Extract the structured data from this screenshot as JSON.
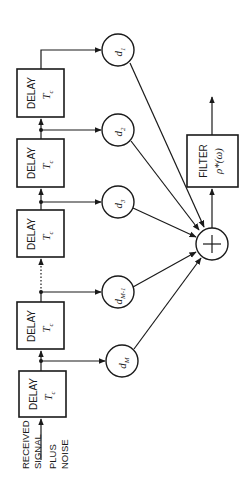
{
  "diagram": {
    "orientation": "rotated-90-ccw",
    "input_label": [
      "RECEIVED",
      "SIGNAL",
      "PLUS",
      "NOISE"
    ],
    "delay_blocks": [
      {
        "label": "DELAY",
        "param": "T",
        "param_sub": "c"
      },
      {
        "label": "DELAY",
        "param": "T",
        "param_sub": "c"
      },
      {
        "label": "DELAY",
        "param": "T",
        "param_sub": "c"
      },
      {
        "label": "DELAY",
        "param": "T",
        "param_sub": "c"
      },
      {
        "label": "DELAY",
        "param": "T",
        "param_sub": "c"
      }
    ],
    "taps": [
      {
        "symbol": "d",
        "sub": "1"
      },
      {
        "symbol": "d",
        "sub": "2"
      },
      {
        "symbol": "d",
        "sub": "3"
      },
      {
        "symbol": "d",
        "sub": "M-1"
      },
      {
        "symbol": "d",
        "sub": "M"
      }
    ],
    "summer": {
      "symbol": "+"
    },
    "filter": {
      "label": "FILTER",
      "func": "ρ*(ω)"
    }
  }
}
